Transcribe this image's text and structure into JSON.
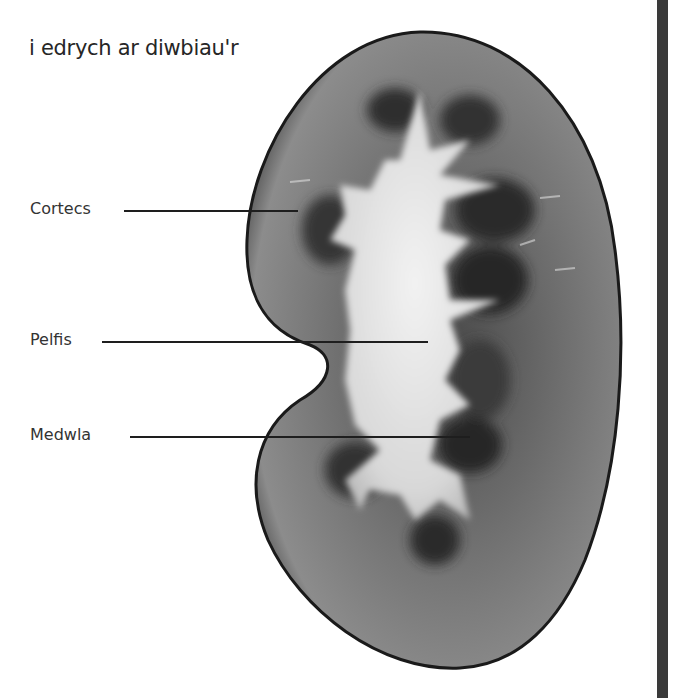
{
  "heading": "i edrych ar diwbiau'r",
  "diagram": {
    "labels": [
      {
        "text": "Cortecs",
        "x": 30,
        "y": 207,
        "line_from": 124,
        "line_to": 298,
        "line_y": 210
      },
      {
        "text": "Pelfis",
        "x": 30,
        "y": 338,
        "line_from": 102,
        "line_to": 428,
        "line_y": 341
      },
      {
        "text": "Medwla",
        "x": 30,
        "y": 432,
        "line_from": 130,
        "line_to": 470,
        "line_y": 436
      }
    ]
  },
  "caption": "",
  "colors": {
    "outline": "#1a1a1a",
    "cortex": "#6e6e6e",
    "medulla": "#3c3c3c",
    "pelvis": "#e6e6e6",
    "side_bar": "#3a3a3a"
  }
}
